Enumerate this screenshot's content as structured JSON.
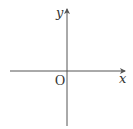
{
  "diagram": {
    "type": "cartesian-axes",
    "x_axis_label": "x",
    "y_axis_label": "y",
    "origin_label": "O",
    "colors": {
      "axis": "#555555",
      "text": "#333333",
      "background": "#ffffff"
    }
  }
}
